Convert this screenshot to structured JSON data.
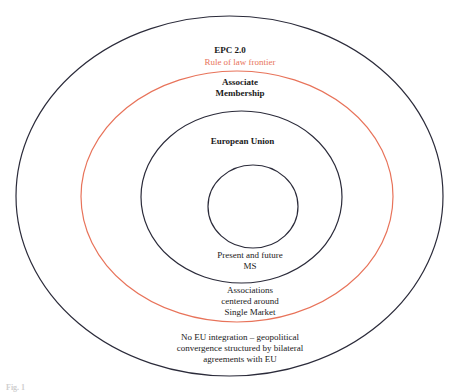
{
  "diagram": {
    "type": "concentric-circles",
    "colors": {
      "ring_stroke": "#2b2b3a",
      "rule_of_law_stroke": "#e8735a",
      "text": "#1a1a1a",
      "rule_of_law_text": "#e8735a"
    },
    "rings": [
      {
        "id": "epc",
        "title": "EPC 2.0",
        "description": "No EU integration – geopolitical\nconvergence structured by bilateral\nagreements with EU"
      },
      {
        "id": "rule-of-law",
        "title": "Rule of law frontier"
      },
      {
        "id": "associate",
        "title": "Associate\nMembership",
        "description": "Associations\ncentered around\nSingle Market"
      },
      {
        "id": "eu",
        "title": "European Union",
        "description": "Present and future\nMS"
      },
      {
        "id": "core",
        "title": ""
      }
    ],
    "caption": "Fig. 1"
  }
}
